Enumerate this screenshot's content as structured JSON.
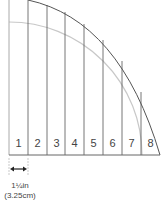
{
  "diagram": {
    "type": "quarter-circle pattern divided into vertical strips",
    "strips": [
      {
        "label": "1"
      },
      {
        "label": "2"
      },
      {
        "label": "3"
      },
      {
        "label": "4"
      },
      {
        "label": "5"
      },
      {
        "label": "6"
      },
      {
        "label": "7"
      },
      {
        "label": "8"
      }
    ],
    "strip_width": {
      "imperial": "1¼in",
      "metric": "(3.25cm)"
    },
    "colors": {
      "outer_arc": "#555555",
      "inner_arc": "#c8c8c8",
      "strip_lines": "#666666",
      "left_edge": "#aaaaaa",
      "text": "#444444"
    }
  }
}
